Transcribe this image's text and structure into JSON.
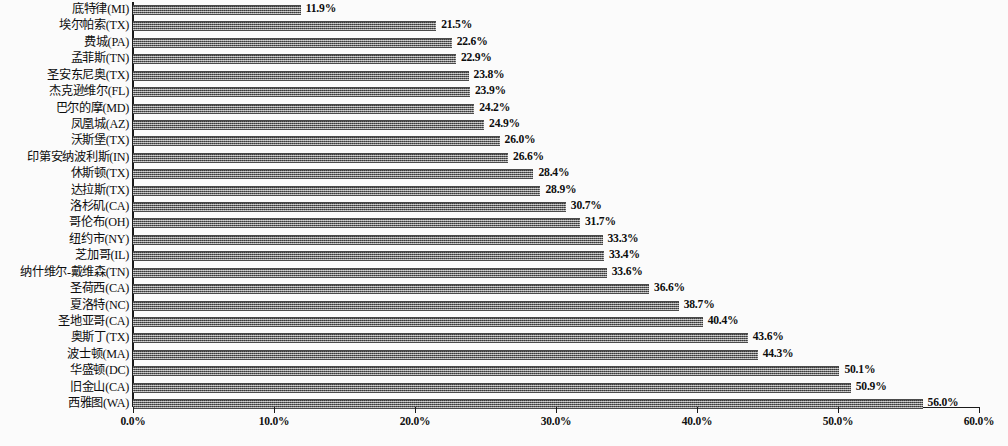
{
  "chart_data": {
    "type": "bar",
    "orientation": "horizontal",
    "title": "",
    "subtitle": "",
    "xlabel": "",
    "ylabel": "",
    "xlim": [
      0,
      60
    ],
    "xtick_labels": [
      "0.0%",
      "10.0%",
      "20.0%",
      "30.0%",
      "40.0%",
      "50.0%",
      "60.0%"
    ],
    "xtick_values": [
      0,
      10,
      20,
      30,
      40,
      50,
      60
    ],
    "grid": false,
    "legend": null,
    "value_label_suffix": "%",
    "categories": [
      "底特律(MI)",
      "埃尔帕索(TX)",
      "费城(PA)",
      "孟菲斯(TN)",
      "圣安东尼奥(TX)",
      "杰克逊维尔(FL)",
      "巴尔的摩(MD)",
      "凤凰城(AZ)",
      "沃斯堡(TX)",
      "印第安纳波利斯(IN)",
      "休斯顿(TX)",
      "达拉斯(TX)",
      "洛杉矶(CA)",
      "哥伦布(OH)",
      "纽约市(NY)",
      "芝加哥(IL)",
      "纳什维尔-戴维森(TN)",
      "圣荷西(CA)",
      "夏洛特(NC)",
      "圣地亚哥(CA)",
      "奥斯丁(TX)",
      "波士顿(MA)",
      "华盛顿(DC)",
      "旧金山(CA)",
      "西雅图(WA)"
    ],
    "values": [
      11.9,
      21.5,
      22.6,
      22.9,
      23.8,
      23.9,
      24.2,
      24.9,
      26.0,
      26.6,
      28.4,
      28.9,
      30.7,
      31.7,
      33.3,
      33.4,
      33.6,
      36.6,
      38.7,
      40.4,
      43.6,
      44.3,
      50.1,
      50.9,
      56.0
    ],
    "value_labels": [
      "11.9%",
      "21.5%",
      "22.6%",
      "22.9%",
      "23.8%",
      "23.9%",
      "24.2%",
      "24.9%",
      "26.0%",
      "26.6%",
      "28.4%",
      "28.9%",
      "30.7%",
      "31.7%",
      "33.3%",
      "33.4%",
      "33.6%",
      "36.6%",
      "38.7%",
      "40.4%",
      "43.6%",
      "44.3%",
      "50.1%",
      "50.9%",
      "56.0%"
    ],
    "bar_color": "#6d6d6d",
    "axis_color": "#1a1a1a",
    "background_color": "#ffffff"
  }
}
